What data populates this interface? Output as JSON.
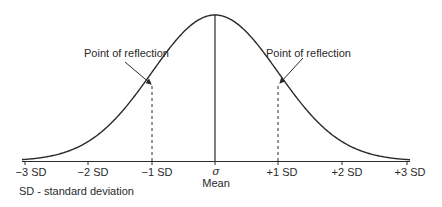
{
  "diagram": {
    "curve_color": "#2a2a2a",
    "axis_color": "#2a2a2a",
    "annotations": {
      "left_inflection": "Point of reflection",
      "right_inflection": "Point of reflection"
    },
    "x_ticks": [
      "−3 SD",
      "−2 SD",
      "−1 SD",
      "σ",
      "+1 SD",
      "+2 SD",
      "+3 SD"
    ],
    "mean_label": "Mean",
    "footnote": "SD - standard deviation"
  }
}
